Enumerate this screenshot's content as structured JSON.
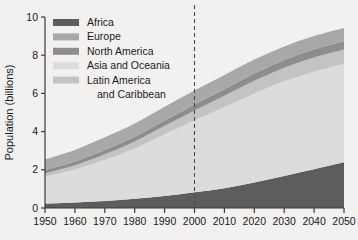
{
  "chart_data": {
    "type": "area",
    "title": "",
    "subtitle": "",
    "xlabel": "",
    "ylabel": "Population (billions)",
    "xlim": [
      1950,
      2050
    ],
    "ylim": [
      0,
      10
    ],
    "grid": false,
    "stacked": true,
    "legend_position": "top-left",
    "x": [
      1950,
      1960,
      1970,
      1980,
      1990,
      2000,
      2010,
      2020,
      2030,
      2040,
      2050
    ],
    "xticklabels": [
      "1950",
      "1960",
      "1970",
      "1980",
      "1990",
      "2000",
      "2010",
      "2020",
      "2030",
      "2040",
      "2050"
    ],
    "yticks": [
      0,
      2,
      4,
      6,
      8,
      10
    ],
    "yticklabels": [
      "0",
      "2",
      "4",
      "6",
      "8",
      "10"
    ],
    "annotations": [
      {
        "type": "vertical-dashed-line",
        "x": 2000,
        "label": "projection-divider"
      }
    ],
    "series": [
      {
        "name": "Africa",
        "color": "#5d5d5d",
        "values": [
          0.23,
          0.29,
          0.37,
          0.48,
          0.63,
          0.82,
          1.04,
          1.34,
          1.68,
          2.03,
          2.39
        ]
      },
      {
        "name": "Asia and Oceania",
        "color": "#dcdcdc",
        "values": [
          1.42,
          1.73,
          2.15,
          2.64,
          3.23,
          3.77,
          4.25,
          4.66,
          4.95,
          5.11,
          5.16
        ]
      },
      {
        "name": "Latin America and Caribbean",
        "color": "#c3c3c3",
        "values": [
          0.17,
          0.22,
          0.29,
          0.36,
          0.44,
          0.52,
          0.59,
          0.66,
          0.71,
          0.74,
          0.75
        ]
      },
      {
        "name": "North America",
        "color": "#8d8d8d",
        "values": [
          0.17,
          0.2,
          0.23,
          0.25,
          0.28,
          0.31,
          0.34,
          0.38,
          0.41,
          0.43,
          0.45
        ]
      },
      {
        "name": "Europe",
        "color": "#a8a8a8",
        "values": [
          0.55,
          0.6,
          0.66,
          0.69,
          0.72,
          0.73,
          0.74,
          0.73,
          0.71,
          0.69,
          0.67
        ]
      }
    ],
    "totals": [
      2.54,
      3.04,
      3.7,
      4.42,
      5.3,
      6.15,
      6.96,
      7.77,
      8.46,
      9.0,
      9.42
    ]
  },
  "legend": {
    "items": [
      {
        "label": "Africa",
        "color": "#5d5d5d"
      },
      {
        "label": "Europe",
        "color": "#a8a8a8"
      },
      {
        "label": "North America",
        "color": "#8d8d8d"
      },
      {
        "label": "Asia and Oceania",
        "color": "#dcdcdc"
      },
      {
        "label": "Latin America",
        "color": "#c3c3c3"
      },
      {
        "label": "and Caribbean",
        "color": ""
      }
    ]
  },
  "axes": {
    "y_title": "Population (billions)"
  },
  "colors": {
    "background": "#f2f1ef",
    "axis": "#3a3a3a",
    "text": "#1a1a1a",
    "dashed_line": "#4a4a4a"
  }
}
